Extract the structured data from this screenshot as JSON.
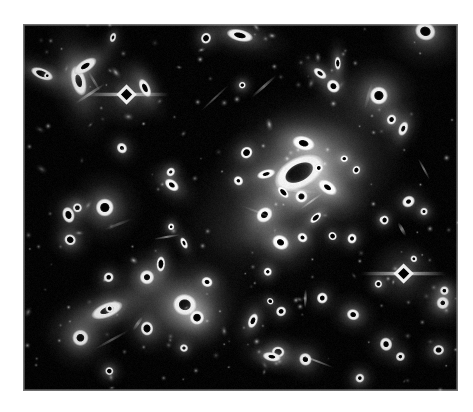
{
  "page": {
    "background_color": "#ffffff",
    "width": 473,
    "height": 412
  },
  "figure": {
    "name": "astronomical-plate",
    "kind": "galaxy-cluster-photographic-plate",
    "caption": "",
    "frame": {
      "x": 23,
      "y": 24,
      "width": 435,
      "height": 367
    },
    "plate_background_color": "#050505",
    "border_color": "#c9c9c9",
    "rendering": {
      "saturated_core_color": "#000000",
      "halo_color": "#ffffff",
      "note": "bright objects are overexposed: white ring with black saturated core"
    },
    "diffuse_light": [
      {
        "name": "primary-intracluster-glow",
        "cx": 0.665,
        "cy": 0.405,
        "rx": 0.23,
        "ry": 0.24,
        "peak": 0.55
      },
      {
        "name": "secondary-intracluster-glow",
        "cx": 0.375,
        "cy": 0.775,
        "rx": 0.165,
        "ry": 0.155,
        "peak": 0.42
      },
      {
        "name": "bridge-glow",
        "cx": 0.52,
        "cy": 0.58,
        "rx": 0.26,
        "ry": 0.2,
        "peak": 0.16
      },
      {
        "name": "upper-right-glow",
        "cx": 0.8,
        "cy": 0.18,
        "rx": 0.17,
        "ry": 0.14,
        "peak": 0.12
      }
    ],
    "objects": [
      {
        "name": "brightest-cluster-galaxy",
        "x": 0.635,
        "y": 0.405,
        "r": 17,
        "core": 11,
        "elong": 1.75,
        "angle": -28,
        "type": "saturated-elliptical"
      },
      {
        "name": "bcg-companion",
        "x": 0.64,
        "y": 0.47,
        "r": 7,
        "core": 4,
        "elong": 1.0,
        "angle": 0,
        "type": "saturated"
      },
      {
        "name": "second-brightest-galaxy",
        "x": 0.372,
        "y": 0.765,
        "r": 12,
        "core": 7,
        "elong": 1.1,
        "angle": 10,
        "type": "saturated"
      },
      {
        "name": "second-brightest-companion",
        "x": 0.4,
        "y": 0.8,
        "r": 8,
        "core": 5,
        "elong": 1.0,
        "angle": 0,
        "type": "saturated"
      },
      {
        "name": "diffraction-star-upper-left",
        "x": 0.238,
        "y": 0.192,
        "r": 11,
        "core": 7,
        "elong": 1.0,
        "angle": 0,
        "type": "diamond-star"
      },
      {
        "name": "diffraction-star-lower-right",
        "x": 0.875,
        "y": 0.68,
        "r": 11,
        "core": 7,
        "elong": 1.0,
        "angle": 0,
        "type": "diamond-star"
      },
      {
        "name": "bright-star-right",
        "x": 0.818,
        "y": 0.195,
        "r": 10,
        "core": 6,
        "elong": 1.0,
        "angle": 0,
        "type": "saturated"
      },
      {
        "name": "bright-star-top-right",
        "x": 0.925,
        "y": 0.02,
        "r": 10,
        "core": 6,
        "elong": 1.15,
        "angle": 20,
        "type": "saturated"
      },
      {
        "name": "bright-galaxy-left",
        "x": 0.188,
        "y": 0.5,
        "r": 10,
        "core": 6,
        "elong": 1.0,
        "angle": 0,
        "type": "saturated"
      },
      {
        "name": "bright-star-lower-left",
        "x": 0.132,
        "y": 0.855,
        "r": 9,
        "core": 5,
        "elong": 1.0,
        "angle": 0,
        "type": "saturated"
      },
      {
        "name": "bright-star-mid-left",
        "x": 0.285,
        "y": 0.69,
        "r": 8,
        "core": 4,
        "elong": 1.0,
        "angle": 0,
        "type": "saturated"
      },
      {
        "name": "edge-on-galaxy-left",
        "x": 0.193,
        "y": 0.78,
        "r": 8,
        "core": 4,
        "elong": 2.3,
        "angle": -22,
        "type": "saturated-edge-on"
      },
      {
        "name": "edge-on-galaxy-upper-left",
        "x": 0.128,
        "y": 0.155,
        "r": 8,
        "core": 4,
        "elong": 2.1,
        "angle": 75,
        "type": "saturated-edge-on"
      },
      {
        "name": "galaxy-near-bcg-left",
        "x": 0.555,
        "y": 0.52,
        "r": 8,
        "core": 4,
        "elong": 1.2,
        "angle": -40,
        "type": "saturated"
      },
      {
        "name": "galaxy-pair-lower-centre",
        "x": 0.592,
        "y": 0.595,
        "r": 8,
        "core": 4,
        "elong": 1.2,
        "angle": 30,
        "type": "saturated"
      },
      {
        "name": "galaxy-upper-centre",
        "x": 0.645,
        "y": 0.325,
        "r": 8,
        "core": 4,
        "elong": 1.6,
        "angle": 15,
        "type": "saturated-edge-on"
      },
      {
        "name": "galaxy-right-of-bcg",
        "x": 0.7,
        "y": 0.445,
        "r": 7,
        "core": 3,
        "elong": 1.7,
        "angle": 35,
        "type": "saturated-edge-on"
      },
      {
        "name": "bright-star-far-right",
        "x": 0.965,
        "y": 0.76,
        "r": 7,
        "core": 3,
        "elong": 1.0,
        "angle": 0,
        "type": "saturated"
      }
    ],
    "counts": {
      "saturated_objects": 86,
      "faint_point_sources": 190,
      "diamond_diffraction_stars": 2,
      "dominant_galaxies": 2
    }
  }
}
